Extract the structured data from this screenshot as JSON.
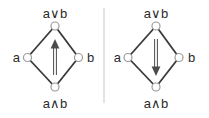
{
  "figure": {
    "colors": {
      "background": "#ffffff",
      "edge": "#3a3a3a",
      "node_fill": "#ffffff",
      "node_stroke": "#9a9a9a",
      "arrow": "#4c4c4c",
      "label": "#2b2b2b",
      "divider": "#c9c9c9"
    },
    "diagrams": [
      {
        "position": "left",
        "top_label": "a∨b",
        "left_label": "a",
        "right_label": "b",
        "bottom_label": "a∧b",
        "arrow_direction": "up"
      },
      {
        "position": "right",
        "top_label": "a∨b",
        "left_label": "a",
        "right_label": "b",
        "bottom_label": "a∧b",
        "arrow_direction": "down"
      }
    ]
  }
}
